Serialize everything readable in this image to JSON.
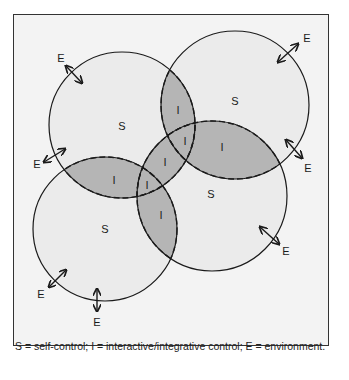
{
  "diagram": {
    "type": "venn",
    "circles": [
      {
        "id": "top-left",
        "label": "S",
        "cx": 122,
        "cy": 125,
        "r": 73
      },
      {
        "id": "top-right",
        "label": "S",
        "cx": 235,
        "cy": 105,
        "r": 74
      },
      {
        "id": "bottom-left",
        "label": "S",
        "cx": 105,
        "cy": 229,
        "r": 72
      },
      {
        "id": "bottom-right",
        "label": "S",
        "cx": 212,
        "cy": 196,
        "r": 75
      }
    ],
    "overlap_label": "I",
    "environment_label": "E",
    "labels": {
      "s_top_left": "S",
      "s_top_right": "S",
      "s_bottom_left": "S",
      "s_bottom_right": "S",
      "i1": "I",
      "i2": "I",
      "i3": "I",
      "i4": "I",
      "i5": "I",
      "i6": "I",
      "i7": "I",
      "e1": "E",
      "e2": "E",
      "e3": "E",
      "e4": "E",
      "e5": "E",
      "e6": "E",
      "e7": "E"
    },
    "caption": "S = self-control; I = interactive/integrative control; E = environment.",
    "colors": {
      "background": "#f3f3f3",
      "circle_fill": "#ebebeb",
      "overlap_fill": "#b5b5b5",
      "stroke": "#1a1a1a"
    }
  }
}
